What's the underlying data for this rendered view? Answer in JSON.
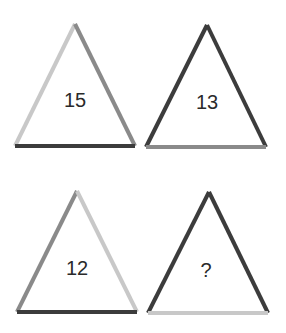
{
  "puzzle": {
    "colors": {
      "light": "#c8c8c8",
      "medium": "#8a8a8a",
      "dark": "#3c3c3c"
    },
    "triangles": [
      {
        "position": "top-left",
        "label": "15",
        "apex": [
          75,
          24
        ],
        "base_left": [
          15,
          146
        ],
        "base_right": [
          135,
          146
        ],
        "label_pos": [
          75,
          102
        ],
        "left_edge": "light",
        "right_edge": "medium",
        "base_edge": "dark"
      },
      {
        "position": "top-right",
        "label": "13",
        "apex": [
          207,
          25
        ],
        "base_left": [
          146,
          147
        ],
        "base_right": [
          266,
          147
        ],
        "label_pos": [
          207,
          104
        ],
        "left_edge": "dark",
        "right_edge": "dark",
        "base_edge": "medium"
      },
      {
        "position": "bottom-left",
        "label": "12",
        "apex": [
          77,
          191
        ],
        "base_left": [
          17,
          312
        ],
        "base_right": [
          137,
          312
        ],
        "label_pos": [
          77,
          270
        ],
        "left_edge": "medium",
        "right_edge": "light",
        "base_edge": "dark"
      },
      {
        "position": "bottom-right",
        "label": "?",
        "apex": [
          209,
          192
        ],
        "base_left": [
          148,
          313
        ],
        "base_right": [
          268,
          313
        ],
        "label_pos": [
          206,
          272
        ],
        "left_edge": "dark",
        "right_edge": "dark",
        "base_edge": "light"
      }
    ]
  }
}
